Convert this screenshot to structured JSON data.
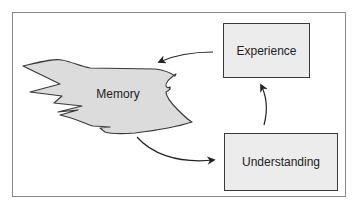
{
  "diagram": {
    "nodes": [
      {
        "id": "memory",
        "label": "Memory",
        "shape": "irregular-blob"
      },
      {
        "id": "experience",
        "label": "Experience",
        "shape": "rectangle"
      },
      {
        "id": "understanding",
        "label": "Understanding",
        "shape": "rectangle"
      }
    ],
    "edges": [
      {
        "from": "experience",
        "to": "memory",
        "style": "curved-arrow"
      },
      {
        "from": "memory",
        "to": "understanding",
        "style": "curved-arrow"
      },
      {
        "from": "understanding",
        "to": "experience",
        "style": "curved-arrow"
      }
    ],
    "colors": {
      "node_fill": "#ececec",
      "blob_fill": "#dcdcdc",
      "stroke": "#3a3a3a",
      "frame": "#8a8a8a",
      "text": "#222222"
    }
  }
}
